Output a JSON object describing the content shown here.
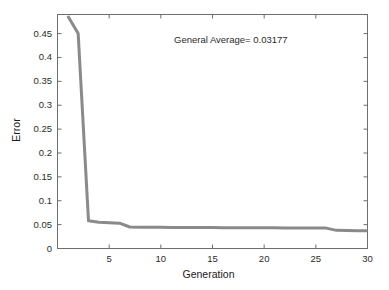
{
  "figure": {
    "background_color": "#ffffff",
    "axes_color": "#6e6e6e",
    "text_color": "#2b2b2b"
  },
  "annotation": {
    "text": "General Average= 0.03177"
  },
  "chart_data": {
    "type": "line",
    "title": "",
    "xlabel": "Generation",
    "ylabel": "Error",
    "xlim": [
      0,
      30
    ],
    "ylim": [
      0,
      0.49
    ],
    "grid": false,
    "legend": null,
    "line_color": "#8a8a8a",
    "line_width": 3,
    "xticks": [
      0,
      5,
      10,
      15,
      20,
      25,
      30
    ],
    "xtick_labels": [
      "0",
      "5",
      "10",
      "15",
      "20",
      "25",
      "30"
    ],
    "yticks": [
      0,
      0.05,
      0.1,
      0.15,
      0.2,
      0.25,
      0.3,
      0.35,
      0.4,
      0.45
    ],
    "ytick_labels": [
      "0",
      "0.05",
      "0.1",
      "0.15",
      "0.2",
      "0.25",
      "0.3",
      "0.35",
      "0.4",
      "0.45"
    ],
    "annotations": [
      {
        "text": "General Average= 0.03177",
        "x": 15.2,
        "y": 0.445
      }
    ],
    "series": [
      {
        "name": "Best Error",
        "x": [
          1,
          2,
          3,
          4,
          5,
          6,
          7,
          8,
          9,
          10,
          11,
          12,
          13,
          14,
          15,
          16,
          17,
          18,
          19,
          20,
          21,
          22,
          23,
          24,
          25,
          26,
          27,
          28,
          29,
          30
        ],
        "values": [
          0.487,
          0.45,
          0.058,
          0.055,
          0.054,
          0.053,
          0.045,
          0.0445,
          0.0444,
          0.0443,
          0.0442,
          0.0441,
          0.044,
          0.0439,
          0.0438,
          0.0437,
          0.0436,
          0.0435,
          0.0434,
          0.0433,
          0.0432,
          0.0431,
          0.043,
          0.0429,
          0.0428,
          0.0427,
          0.038,
          0.0375,
          0.0372,
          0.037
        ]
      }
    ]
  }
}
